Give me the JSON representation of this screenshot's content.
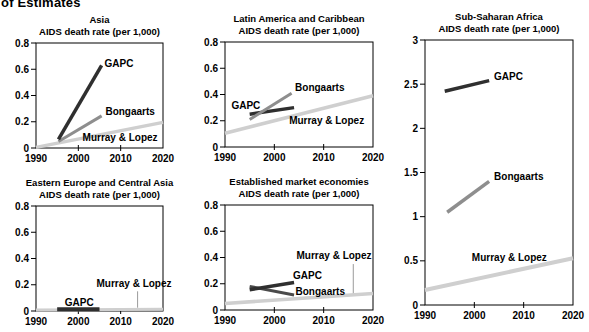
{
  "page": {
    "header_fragment": "of Estimates",
    "background": "#ffffff",
    "text_color": "#000000",
    "axis_color": "#000000"
  },
  "chart_data": [
    {
      "id": "asia",
      "type": "line",
      "title": "Asia",
      "subtitle": "AIDS death rate (per 1,000)",
      "xlabel": "",
      "ylabel": "",
      "xlim": [
        1990,
        2020
      ],
      "ylim": [
        0,
        0.8
      ],
      "grid": false,
      "xticks": [
        {
          "v": 1990,
          "label": "1990"
        },
        {
          "v": 2000,
          "label": "2000"
        },
        {
          "v": 2010,
          "label": "2010"
        },
        {
          "v": 2020,
          "label": "2020"
        }
      ],
      "yticks": [
        {
          "v": 0,
          "label": "0"
        },
        {
          "v": 0.2,
          "label": "0.2"
        },
        {
          "v": 0.4,
          "label": "0.4"
        },
        {
          "v": 0.6,
          "label": "0.6"
        },
        {
          "v": 0.8,
          "label": "0.8"
        }
      ],
      "series": [
        {
          "name": "Murray & Lopez",
          "color": "#cfcfcf",
          "width": 3.5,
          "points": [
            [
              1990,
              0.005
            ],
            [
              2020,
              0.195
            ]
          ],
          "label": {
            "x": 2001,
            "y": 0.05,
            "anchor": "start"
          }
        },
        {
          "name": "Bongaarts",
          "color": "#8e8e8e",
          "width": 3,
          "points": [
            [
              1995.3,
              0.05
            ],
            [
              2005.5,
              0.245
            ]
          ],
          "label": {
            "x": 2006.4,
            "y": 0.25,
            "anchor": "start"
          }
        },
        {
          "name": "GAPC",
          "color": "#2f2f2f",
          "width": 3.5,
          "points": [
            [
              1995.3,
              0.065
            ],
            [
              2005.5,
              0.63
            ]
          ],
          "label": {
            "x": 2006.2,
            "y": 0.62,
            "anchor": "start"
          }
        }
      ]
    },
    {
      "id": "latin-america-and-caribbean",
      "type": "line",
      "title": "Latin America and Caribbean",
      "subtitle": "AIDS death rate (per 1,000)",
      "xlabel": "",
      "ylabel": "",
      "xlim": [
        1990,
        2020
      ],
      "ylim": [
        0,
        0.8
      ],
      "grid": false,
      "xticks": [
        {
          "v": 1990,
          "label": "1990"
        },
        {
          "v": 2000,
          "label": "2000"
        },
        {
          "v": 2010,
          "label": "2010"
        },
        {
          "v": 2020,
          "label": "2020"
        }
      ],
      "yticks": [
        {
          "v": 0,
          "label": "0"
        },
        {
          "v": 0.2,
          "label": "0.2"
        },
        {
          "v": 0.4,
          "label": "0.4"
        },
        {
          "v": 0.6,
          "label": "0.6"
        },
        {
          "v": 0.8,
          "label": "0.8"
        }
      ],
      "series": [
        {
          "name": "Murray & Lopez",
          "color": "#cfcfcf",
          "width": 3.5,
          "points": [
            [
              1990,
              0.105
            ],
            [
              2020,
              0.39
            ]
          ],
          "label": {
            "x": 2003,
            "y": 0.175,
            "anchor": "start"
          }
        },
        {
          "name": "GAPC",
          "color": "#2f2f2f",
          "width": 3.5,
          "points": [
            [
              1995,
              0.25
            ],
            [
              2004,
              0.3
            ]
          ],
          "label": {
            "x": 1991.3,
            "y": 0.29,
            "anchor": "start"
          }
        },
        {
          "name": "Bongaarts",
          "color": "#8e8e8e",
          "width": 3,
          "points": [
            [
              1995,
              0.21
            ],
            [
              2003.5,
              0.41
            ]
          ],
          "label": {
            "x": 2004.2,
            "y": 0.425,
            "anchor": "start"
          }
        }
      ]
    },
    {
      "id": "sub-saharan-africa",
      "type": "line",
      "title": "Sub-Saharan Africa",
      "subtitle": "AIDS death rate (per 1,000)",
      "xlabel": "",
      "ylabel": "",
      "xlim": [
        1990,
        2020
      ],
      "ylim": [
        0,
        3
      ],
      "grid": false,
      "xticks": [
        {
          "v": 1990,
          "label": "1990"
        },
        {
          "v": 2000,
          "label": "2000"
        },
        {
          "v": 2010,
          "label": "2010"
        },
        {
          "v": 2020,
          "label": "2020"
        }
      ],
      "yticks": [
        {
          "v": 0,
          "label": "0"
        },
        {
          "v": 0.5,
          "label": "0.5"
        },
        {
          "v": 1,
          "label": "1"
        },
        {
          "v": 1.5,
          "label": "1.5"
        },
        {
          "v": 2,
          "label": "2"
        },
        {
          "v": 2.5,
          "label": "2.5"
        },
        {
          "v": 3,
          "label": "3"
        }
      ],
      "series": [
        {
          "name": "Murray & Lopez",
          "color": "#cfcfcf",
          "width": 4,
          "points": [
            [
              1990,
              0.17
            ],
            [
              2020,
              0.53
            ]
          ],
          "label": {
            "x": 1999.5,
            "y": 0.5,
            "anchor": "start"
          }
        },
        {
          "name": "Bongaarts",
          "color": "#8e8e8e",
          "width": 3.5,
          "points": [
            [
              1994.5,
              1.05
            ],
            [
              2003,
              1.4
            ]
          ],
          "label": {
            "x": 2004,
            "y": 1.42,
            "anchor": "start"
          }
        },
        {
          "name": "GAPC",
          "color": "#2f2f2f",
          "width": 3.5,
          "points": [
            [
              1994,
              2.42
            ],
            [
              2003,
              2.54
            ]
          ],
          "label": {
            "x": 2004,
            "y": 2.55,
            "anchor": "start"
          }
        }
      ]
    },
    {
      "id": "eastern-europe-and-central-asia",
      "type": "line",
      "title": "Eastern Europe and Central Asia",
      "subtitle": "AIDS death rate (per 1,000)",
      "xlabel": "",
      "ylabel": "",
      "xlim": [
        1990,
        2020
      ],
      "ylim": [
        0,
        0.8
      ],
      "grid": false,
      "xticks": [
        {
          "v": 1990,
          "label": "1990"
        },
        {
          "v": 2000,
          "label": "2000"
        },
        {
          "v": 2010,
          "label": "2010"
        },
        {
          "v": 2020,
          "label": "2020"
        }
      ],
      "yticks": [
        {
          "v": 0,
          "label": "0"
        },
        {
          "v": 0.2,
          "label": "0.2"
        },
        {
          "v": 0.4,
          "label": "0.4"
        },
        {
          "v": 0.6,
          "label": "0.6"
        },
        {
          "v": 0.8,
          "label": "0.8"
        }
      ],
      "series": [
        {
          "name": "Murray & Lopez",
          "color": "#cfcfcf",
          "width": 3,
          "points": [
            [
              1990,
              0.008
            ],
            [
              2020,
              0.013
            ]
          ],
          "label": {
            "x": 2004.3,
            "y": 0.185,
            "anchor": "start"
          },
          "leader": {
            "x": 2014,
            "y1": 0.15,
            "y2": 0.025
          }
        },
        {
          "name": "GAPC",
          "color": "#2f2f2f",
          "width": 4,
          "points": [
            [
              1995,
              0.013
            ],
            [
              2005,
              0.013
            ]
          ],
          "label": {
            "x": 1996.8,
            "y": 0.035,
            "anchor": "start"
          }
        }
      ]
    },
    {
      "id": "established-market-economies",
      "type": "line",
      "title": "Established market economies",
      "subtitle": "AIDS death rate (per 1,000)",
      "xlabel": "",
      "ylabel": "",
      "xlim": [
        1990,
        2020
      ],
      "ylim": [
        0,
        0.8
      ],
      "grid": false,
      "xticks": [
        {
          "v": 1990,
          "label": "1990"
        },
        {
          "v": 2000,
          "label": "2000"
        },
        {
          "v": 2010,
          "label": "2010"
        },
        {
          "v": 2020,
          "label": "2020"
        }
      ],
      "yticks": [
        {
          "v": 0,
          "label": "0"
        },
        {
          "v": 0.2,
          "label": "0.2"
        },
        {
          "v": 0.4,
          "label": "0.4"
        },
        {
          "v": 0.6,
          "label": "0.6"
        },
        {
          "v": 0.8,
          "label": "0.8"
        }
      ],
      "series": [
        {
          "name": "Murray & Lopez",
          "color": "#cfcfcf",
          "width": 3.5,
          "points": [
            [
              1990,
              0.05
            ],
            [
              2020,
              0.125
            ]
          ],
          "label": {
            "x": 2004.5,
            "y": 0.385,
            "anchor": "start"
          },
          "leader": {
            "x": 2016,
            "y1": 0.35,
            "y2": 0.12
          }
        },
        {
          "name": "Bongaarts",
          "color": "#4a4a4a",
          "width": 3,
          "points": [
            [
              1995,
              0.18
            ],
            [
              2004,
              0.115
            ]
          ],
          "label": {
            "x": 2004.3,
            "y": 0.115,
            "anchor": "start"
          }
        },
        {
          "name": "GAPC",
          "color": "#2f2f2f",
          "width": 3.5,
          "points": [
            [
              1995,
              0.155
            ],
            [
              2004,
              0.21
            ]
          ],
          "label": {
            "x": 2003.8,
            "y": 0.24,
            "anchor": "start"
          }
        }
      ]
    }
  ]
}
